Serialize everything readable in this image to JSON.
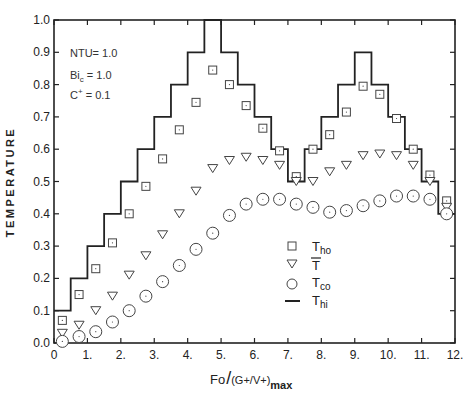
{
  "chart_data": {
    "type": "line",
    "title": "",
    "xlabel": "Fo/(G+/V+)max",
    "ylabel": "TEMPERATURE",
    "xlim": [
      0,
      12
    ],
    "ylim": [
      0.0,
      1.0
    ],
    "x_ticks": [
      "0",
      "1.",
      "2.",
      "3.",
      "4.",
      "5.",
      "6.",
      "7.",
      "8.",
      "9.",
      "10.",
      "11.",
      "12."
    ],
    "y_ticks": [
      "0.0",
      "0.1",
      "0.2",
      "0.3",
      "0.4",
      "0.5",
      "0.6",
      "0.7",
      "0.8",
      "0.9",
      "1.0"
    ],
    "grid": false,
    "annotations": [
      "NTU= 1.0",
      "Bic = 1.0",
      "C+ = 0.1"
    ],
    "legend_position": "lower-center",
    "x": [
      0.25,
      0.75,
      1.25,
      1.75,
      2.25,
      2.75,
      3.25,
      3.75,
      4.25,
      4.75,
      5.25,
      5.75,
      6.25,
      6.75,
      7.25,
      7.75,
      8.25,
      8.75,
      9.25,
      9.75,
      10.25,
      10.75,
      11.25,
      11.75
    ],
    "series": [
      {
        "name": "Tho",
        "marker": "square",
        "values": [
          0.07,
          0.15,
          0.23,
          0.31,
          0.4,
          0.485,
          0.57,
          0.66,
          0.745,
          0.845,
          0.8,
          0.735,
          0.665,
          0.595,
          0.515,
          0.6,
          0.645,
          0.715,
          0.795,
          0.77,
          0.695,
          0.6,
          0.52,
          0.44
        ]
      },
      {
        "name": "T̄",
        "marker": "triangle-down",
        "values": [
          0.03,
          0.055,
          0.1,
          0.145,
          0.21,
          0.27,
          0.335,
          0.4,
          0.47,
          0.54,
          0.565,
          0.575,
          0.565,
          0.55,
          0.5,
          0.5,
          0.53,
          0.55,
          0.58,
          0.585,
          0.58,
          0.55,
          0.5,
          0.42
        ]
      },
      {
        "name": "Tco",
        "marker": "circle",
        "values": [
          0.005,
          0.02,
          0.035,
          0.065,
          0.1,
          0.145,
          0.19,
          0.24,
          0.29,
          0.34,
          0.395,
          0.43,
          0.445,
          0.445,
          0.43,
          0.42,
          0.405,
          0.41,
          0.425,
          0.44,
          0.455,
          0.455,
          0.445,
          0.4
        ]
      },
      {
        "name": "Thi",
        "marker": "step-line",
        "step_x": [
          0,
          0.5,
          1,
          1.5,
          2,
          2.5,
          3,
          3.5,
          4,
          4.5,
          5,
          5.5,
          6,
          6.5,
          7,
          7.5,
          8,
          8.5,
          9,
          9.5,
          10,
          10.5,
          11,
          11.5,
          12
        ],
        "values": [
          0.1,
          0.2,
          0.3,
          0.4,
          0.5,
          0.6,
          0.7,
          0.8,
          0.9,
          1.0,
          0.9,
          0.8,
          0.7,
          0.6,
          0.5,
          0.6,
          0.7,
          0.8,
          0.9,
          0.8,
          0.7,
          0.6,
          0.5,
          0.4
        ]
      }
    ]
  },
  "labels": {
    "ylabel": "TEMPERATURE",
    "xlabel_main": "Fo",
    "xlabel_frac": "(G+/V+)",
    "xlabel_sub": "max",
    "ann_ntu": "NTU= 1.0",
    "ann_bic_main": "Bi",
    "ann_bic_sub": "c",
    "ann_bic_val": " = 1.0",
    "ann_c_main": "C",
    "ann_c_sup": "+",
    "ann_c_val": " = 0.1",
    "legend": [
      {
        "main": "T",
        "sub": "ho"
      },
      {
        "main": "T",
        "sub": ""
      },
      {
        "main": "T",
        "sub": "co"
      },
      {
        "main": "T",
        "sub": "hi"
      }
    ]
  }
}
